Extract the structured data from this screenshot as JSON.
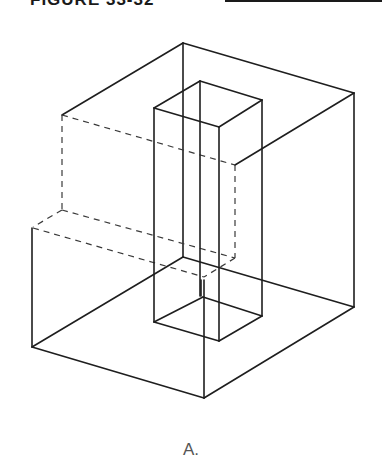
{
  "header": {
    "title": "FIGURE 33-32"
  },
  "figure": {
    "type": "isometric-drawing",
    "caption": "A.",
    "line_styles": {
      "visible": "solid",
      "hidden": "dashed"
    },
    "colors": {
      "line": "#1e1e1e",
      "caption": "#555555"
    }
  }
}
